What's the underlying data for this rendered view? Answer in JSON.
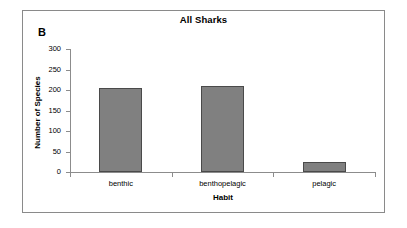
{
  "figure": {
    "panel_label": "B",
    "background": "#ffffff",
    "frame_color": "#8a8a8a"
  },
  "chart_data": {
    "type": "bar",
    "title": "All Sharks",
    "xlabel": "Habit",
    "ylabel": "Number of Species",
    "categories": [
      "benthic",
      "benthopelagic",
      "pelagic"
    ],
    "values": [
      206,
      210,
      24
    ],
    "ylim": [
      0,
      300
    ],
    "yticks": [
      0,
      50,
      100,
      150,
      200,
      250,
      300
    ],
    "ytick_labels": [
      "0",
      "50",
      "100",
      "150",
      "200",
      "250",
      "300"
    ],
    "grid": false,
    "legend": null,
    "bar_color": "#808080",
    "bar_edge_color": "#4a4a4a",
    "axis_color": "#8c8c8c"
  }
}
